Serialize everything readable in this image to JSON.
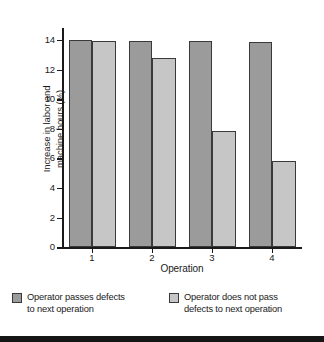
{
  "chart_data": {
    "type": "bar",
    "title": "",
    "xlabel": "Operation",
    "ylabel": "Increase in labor and\nmachine hours (%)",
    "categories": [
      "1",
      "2",
      "3",
      "4"
    ],
    "series": [
      {
        "name": "Operator passes defects\nto next operation",
        "color": "#9b9b9b",
        "values": [
          14.0,
          13.95,
          13.9,
          13.85
        ]
      },
      {
        "name": "Operator does not pass\ndefects to next operation",
        "color": "#c6c6c6",
        "values": [
          13.95,
          12.8,
          7.85,
          5.8
        ]
      }
    ],
    "ylim": [
      0,
      14.8
    ],
    "yticks": [
      0,
      2,
      4,
      6,
      8,
      10,
      12,
      14
    ],
    "ytick_labels": [
      "0",
      "2",
      "4",
      "6",
      "8",
      "10",
      "12",
      "14"
    ],
    "grid": false,
    "legend_position": "below"
  },
  "legend": {
    "entries": [
      {
        "label": "Operator passes defects\nto next operation",
        "color": "#9b9b9b"
      },
      {
        "label": "Operator does not pass\ndefects to next operation",
        "color": "#c6c6c6"
      }
    ]
  },
  "colors": {
    "series_dark": "#9b9b9b",
    "series_light": "#c6c6c6",
    "axis": "#1a1a1a",
    "bar_border": "#3a3a3a",
    "background": "#ffffff",
    "bottom_band": "#151515"
  }
}
